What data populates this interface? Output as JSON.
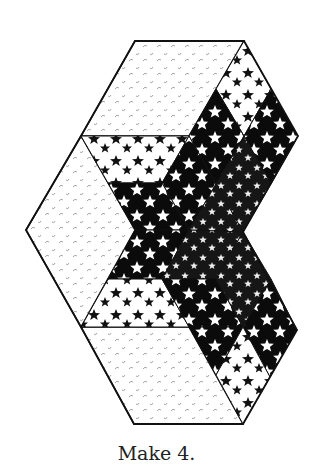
{
  "caption": "Make 4.",
  "fabrics": {
    "background": {
      "name": "light tone-on-tone dot print",
      "color": "#ffffff",
      "motif_color": "#9a9a9a"
    },
    "light_star": {
      "name": "white with black stars",
      "color": "#ffffff",
      "motif_color": "#111111"
    },
    "dark_star": {
      "name": "black with white stars",
      "color": "#0b0b0b",
      "motif_color": "#ffffff"
    },
    "dark_small_star": {
      "name": "dark with small white stars",
      "color": "#141414",
      "motif_color": "#f0f0f0"
    }
  },
  "outline_color": "#111111",
  "pieces": [
    {
      "id": "top-panel",
      "fabric": "background"
    },
    {
      "id": "left-panel",
      "fabric": "background"
    },
    {
      "id": "bottom-panel",
      "fabric": "background"
    },
    {
      "id": "star-point-top",
      "fabric": "dark_star"
    },
    {
      "id": "star-point-left",
      "fabric": "dark_star"
    },
    {
      "id": "star-point-bottom",
      "fabric": "dark_star"
    }
  ]
}
